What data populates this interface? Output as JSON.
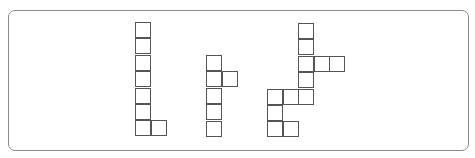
{
  "diagram": {
    "cell_size": 16,
    "colors": {
      "stroke": "#555555",
      "frame": "#8a8a8a",
      "fill": "#ffffff"
    },
    "shapes": [
      {
        "id": "shape-1",
        "origin": [
          135,
          22
        ],
        "cells": [
          [
            0,
            0
          ],
          [
            0,
            1
          ],
          [
            0,
            2
          ],
          [
            0,
            3
          ],
          [
            0,
            4
          ],
          [
            0,
            5
          ],
          [
            0,
            6
          ],
          [
            1,
            6
          ]
        ]
      },
      {
        "id": "shape-2",
        "origin": [
          206,
          55
        ],
        "cells": [
          [
            0,
            0
          ],
          [
            0,
            1
          ],
          [
            1,
            1
          ],
          [
            0,
            2
          ],
          [
            0,
            3
          ],
          [
            0,
            4
          ]
        ]
      },
      {
        "id": "shape-3",
        "origin": [
          267,
          23
        ],
        "cells": [
          [
            2,
            0
          ],
          [
            2,
            1
          ],
          [
            2,
            2
          ],
          [
            3,
            2
          ],
          [
            4,
            2
          ],
          [
            2,
            3
          ],
          [
            0,
            4
          ],
          [
            1,
            4
          ],
          [
            2,
            4
          ],
          [
            0,
            5
          ],
          [
            0,
            6
          ],
          [
            1,
            6
          ]
        ]
      }
    ]
  }
}
